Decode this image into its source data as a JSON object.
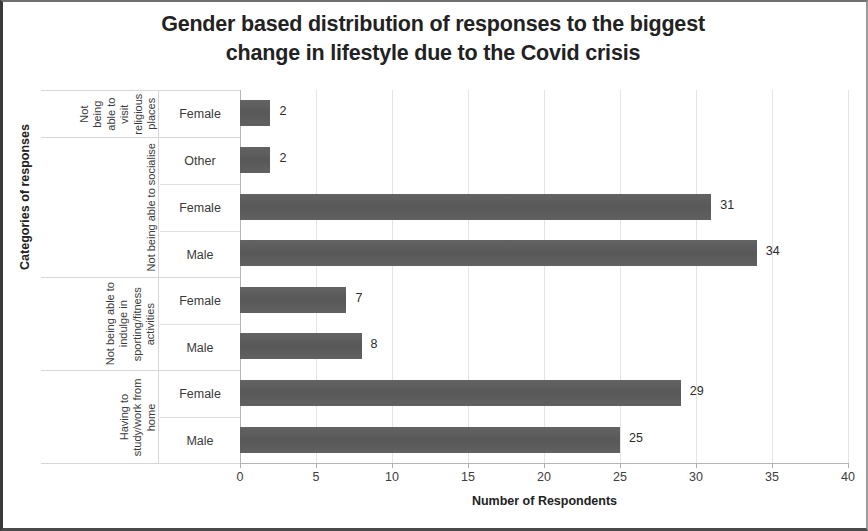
{
  "chart_data": {
    "type": "bar",
    "orientation": "horizontal",
    "title": "Gender based distribution of responses to the biggest change in lifestyle due to the Covid crisis",
    "title_line1": "Gender based distribution of responses to the biggest",
    "title_line2": "change in lifestyle due to the Covid crisis",
    "xlabel": "Number of Respondents",
    "ylabel": "Categories of responses",
    "xlim": [
      0,
      40
    ],
    "xticks": [
      0,
      5,
      10,
      15,
      20,
      25,
      30,
      35,
      40
    ],
    "xtick_labels": [
      "0",
      "5",
      "10",
      "15",
      "20",
      "25",
      "30",
      "35",
      "40"
    ],
    "grid": true,
    "legend": "none",
    "bar_color": "#5e5e5e",
    "categories": [
      "Not being able to visit religious places - Female",
      "Not being able to socialise - Other",
      "Not being able to socialise - Female",
      "Not being able to socialise - Male",
      "Not being able to indulge in sporting/fitness activities - Female",
      "Not being able to indulge in sporting/fitness activities - Male",
      "Having to study/work from home - Female",
      "Having to study/work from home - Male"
    ],
    "values": [
      2,
      2,
      31,
      34,
      7,
      8,
      29,
      25
    ],
    "groups": [
      {
        "label": "Not being able to visit religious places",
        "rows": [
          {
            "gender": "Female",
            "value": 2
          }
        ]
      },
      {
        "label": "Not being able to socialise",
        "rows": [
          {
            "gender": "Other",
            "value": 2
          },
          {
            "gender": "Female",
            "value": 31
          },
          {
            "gender": "Male",
            "value": 34
          }
        ]
      },
      {
        "label": "Not being able to indulge in sporting/fitness activities",
        "rows": [
          {
            "gender": "Female",
            "value": 7
          },
          {
            "gender": "Male",
            "value": 8
          }
        ]
      },
      {
        "label": "Having to study/work from home",
        "rows": [
          {
            "gender": "Female",
            "value": 29
          },
          {
            "gender": "Male",
            "value": 25
          }
        ]
      }
    ]
  }
}
